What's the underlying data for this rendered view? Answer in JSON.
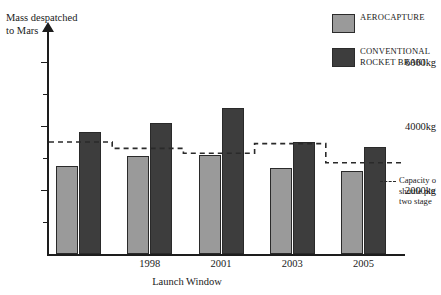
{
  "chart_data": {
    "type": "bar",
    "title": "",
    "xlabel": "Launch Window",
    "ylabel": "Mass despatched to Mars",
    "categories": [
      "",
      "1998",
      "2001",
      "2003",
      "2005"
    ],
    "ylim": [
      0,
      7000
    ],
    "yticks": [
      1000,
      2000,
      3000,
      4000,
      5000,
      6000,
      7000
    ],
    "ytick_labels": [
      "",
      "2000kg",
      "",
      "4000kg",
      "",
      "6000kg",
      ""
    ],
    "ytick_major": [
      2000,
      4000,
      6000
    ],
    "grid": false,
    "legend_position": "top-right",
    "series": [
      {
        "name": "AEROCAPTURE",
        "color": "#9a9a9a",
        "values": [
          2750,
          3050,
          3100,
          2700,
          2600
        ]
      },
      {
        "name": "CONVENTIONAL ROCKET BRAKING",
        "color": "#3d3d3d",
        "values": [
          3800,
          4100,
          4550,
          3500,
          3350
        ]
      }
    ],
    "annotations": [
      {
        "name": "capacity-step-line",
        "label": "Capacity o\nshuttle plu\ntwo stage",
        "style": "dashed",
        "color": "#2a2a2a",
        "step_values": [
          3500,
          3300,
          3150,
          3450,
          2850
        ]
      }
    ]
  },
  "axes": {
    "y_title": "Mass despatched\nto Mars",
    "x_title": "Launch Window"
  },
  "legend": {
    "items": [
      {
        "label": "AEROCAPTURE",
        "swatch": "aerocapture"
      },
      {
        "label": "CONVENTIONAL\nROCKET BRAKI",
        "swatch": "rocket"
      }
    ]
  },
  "capacity_note": {
    "text": "Capacity o\nshuttle plu\ntwo stage"
  },
  "colors": {
    "aerocapture": "#9a9a9a",
    "rocket": "#3d3d3d",
    "axis": "#1d1d1d",
    "background": "#ffffff"
  }
}
